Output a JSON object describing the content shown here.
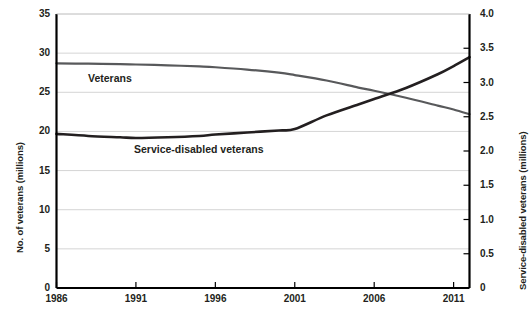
{
  "chart_data": {
    "type": "line",
    "title": "",
    "subtitle": "",
    "xlabel": "",
    "ylabel": "No. of veterans (millions)",
    "ylabel_right": "Service-disabled veterans (millions)",
    "grid": true,
    "legend_position": "inline-annotations",
    "xlim": [
      1986,
      2012
    ],
    "ylim": [
      0,
      35
    ],
    "ylim_right": [
      0,
      4.0
    ],
    "xticks": [
      1986,
      1991,
      1996,
      2001,
      2006,
      2011
    ],
    "xtick_labels": [
      "1986",
      "1991",
      "1996",
      "2001",
      "2006",
      "2011"
    ],
    "yticks_left": [
      0,
      5,
      10,
      15,
      20,
      25,
      30,
      35
    ],
    "ytick_labels_left": [
      "0",
      "5",
      "10",
      "15",
      "20",
      "25",
      "30",
      "35"
    ],
    "yticks_right": [
      0,
      0.5,
      1.0,
      1.5,
      2.0,
      2.5,
      3.0,
      3.5,
      4.0
    ],
    "ytick_labels_right": [
      "0",
      "0.5",
      "1.0",
      "1.5",
      "2.0",
      "2.5",
      "3.0",
      "3.5",
      "4.0"
    ],
    "series": [
      {
        "name": "Veterans",
        "axis": "left",
        "color": "#58595b",
        "x": [
          1986,
          1988,
          1990,
          1991,
          1993,
          1995,
          1996,
          1998,
          2000,
          2001,
          2003,
          2005,
          2006,
          2008,
          2010,
          2011,
          2012
        ],
        "values": [
          28.7,
          28.65,
          28.6,
          28.55,
          28.45,
          28.3,
          28.2,
          27.9,
          27.5,
          27.2,
          26.5,
          25.6,
          25.2,
          24.3,
          23.3,
          22.8,
          22.2
        ]
      },
      {
        "name": "Service-disabled veterans",
        "axis": "right",
        "color": "#231f20",
        "x": [
          1986,
          1988,
          1990,
          1991,
          1993,
          1995,
          1996,
          1998,
          2000,
          2001,
          2003,
          2005,
          2006,
          2008,
          2010,
          2011,
          2012
        ],
        "values": [
          2.25,
          2.22,
          2.2,
          2.19,
          2.2,
          2.22,
          2.24,
          2.27,
          2.3,
          2.32,
          2.52,
          2.68,
          2.76,
          2.92,
          3.12,
          3.24,
          3.37
        ]
      }
    ],
    "annotations": [
      {
        "name": "Veterans",
        "text": "Veterans"
      },
      {
        "name": "Service-disabled veterans",
        "text": "Service-disabled veterans"
      }
    ]
  },
  "caption": ""
}
